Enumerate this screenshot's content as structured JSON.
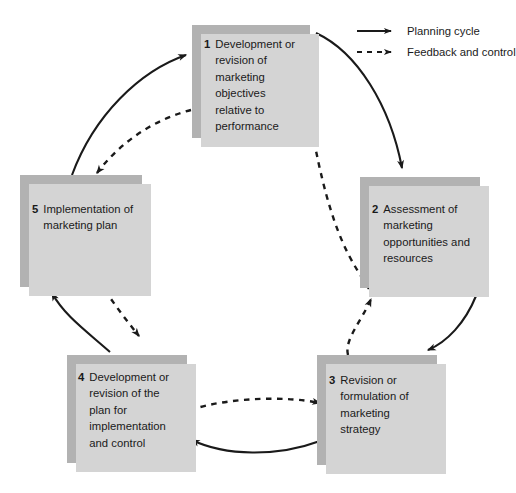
{
  "diagram": {
    "box_fill_color": "#b2b2b2",
    "box_shadow_color": "#d4d4d4",
    "text_color": "#1a1a1a",
    "arrow_color": "#1a1a1a",
    "background_color": "#ffffff",
    "stages": [
      {
        "number": "1",
        "text": "Development or revision of marketing objectives relative to performance"
      },
      {
        "number": "2",
        "text": "Assessment of marketing opportunities and resources"
      },
      {
        "number": "3",
        "text": "Revision or formulation of marketing strategy"
      },
      {
        "number": "4",
        "text": "Development or revision of the plan for implementation and control"
      },
      {
        "number": "5",
        "text": "Implementation of marketing plan"
      }
    ]
  },
  "legend": {
    "items": [
      {
        "label": "Planning cycle",
        "style": "solid",
        "icon": "solid-arrow-icon"
      },
      {
        "label": "Feedback and control",
        "style": "dashed",
        "icon": "dashed-arrow-icon"
      }
    ]
  },
  "connections": {
    "planning_cycle": [
      {
        "from": "1",
        "to": "2"
      },
      {
        "from": "2",
        "to": "3"
      },
      {
        "from": "3",
        "to": "4"
      },
      {
        "from": "4",
        "to": "5"
      },
      {
        "from": "5",
        "to": "1"
      }
    ],
    "feedback_and_control": [
      {
        "from": "2",
        "to": "1"
      },
      {
        "from": "3",
        "to": "2"
      },
      {
        "from": "4",
        "to": "3"
      },
      {
        "from": "5",
        "to": "4"
      },
      {
        "from": "1",
        "to": "5"
      }
    ]
  }
}
